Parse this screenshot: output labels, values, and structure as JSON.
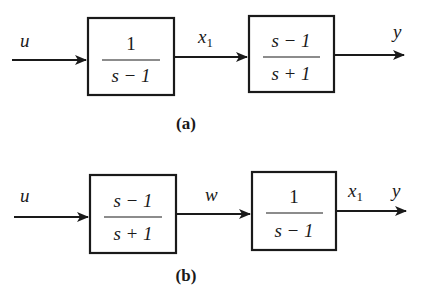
{
  "diagrams": [
    {
      "caption": "(a)",
      "input_label": "u",
      "blocks": [
        {
          "numerator": "1",
          "denominator": "s − 1"
        },
        {
          "numerator": "s − 1",
          "denominator": "s + 1"
        }
      ],
      "intermediate_label": "x",
      "intermediate_sub": "1",
      "output_label": "y"
    },
    {
      "caption": "(b)",
      "input_label": "u",
      "blocks": [
        {
          "numerator": "s − 1",
          "denominator": "s + 1"
        },
        {
          "numerator": "1",
          "denominator": "s − 1"
        }
      ],
      "intermediate_label": "w",
      "state_label": "x",
      "state_sub": "1",
      "output_label": "y"
    }
  ],
  "colors": {
    "ink": "#1a1a1a",
    "background": "#ffffff"
  }
}
